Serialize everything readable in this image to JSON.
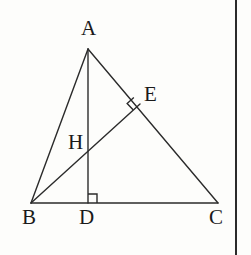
{
  "figure": {
    "width": 251,
    "height": 255,
    "background_color": "#fdfdfb",
    "stroke_color": "#2b2b2b",
    "label_color": "#1a1a1a",
    "stroke_width": 1.4
  },
  "border": {
    "right_rule_x": 235,
    "color": "#2b2b2b",
    "width": 2
  },
  "points": {
    "A": {
      "label": "A",
      "x": 88,
      "y": 49,
      "label_x": 81,
      "label_y": 18
    },
    "B": {
      "label": "B",
      "x": 31,
      "y": 203,
      "label_x": 22,
      "label_y": 207
    },
    "C": {
      "label": "C",
      "x": 218,
      "y": 203,
      "label_x": 209,
      "label_y": 207
    },
    "D": {
      "label": "D",
      "x": 88,
      "y": 203,
      "label_x": 79,
      "label_y": 207
    },
    "E": {
      "label": "E",
      "x": 140,
      "y": 104,
      "label_x": 144,
      "label_y": 84
    },
    "H": {
      "label": "H",
      "x": 88,
      "y": 148,
      "label_x": 68,
      "label_y": 132
    }
  },
  "segments": [
    {
      "name": "side-AB",
      "from": "A",
      "to": "B"
    },
    {
      "name": "side-AC",
      "from": "A",
      "to": "C"
    },
    {
      "name": "side-BC",
      "from": "B",
      "to": "C"
    },
    {
      "name": "altitude-AD",
      "from": "A",
      "to": "D"
    },
    {
      "name": "altitude-BE",
      "from": "B",
      "to": "E"
    }
  ],
  "right_angle_marks": [
    {
      "name": "right-angle-at-D",
      "at": "D",
      "size": 9,
      "orientation": "axis-aligned",
      "opens_toward": "C"
    },
    {
      "name": "right-angle-at-E",
      "at": "E",
      "size": 9,
      "orientation": "rotated",
      "opens_toward": "B"
    }
  ]
}
